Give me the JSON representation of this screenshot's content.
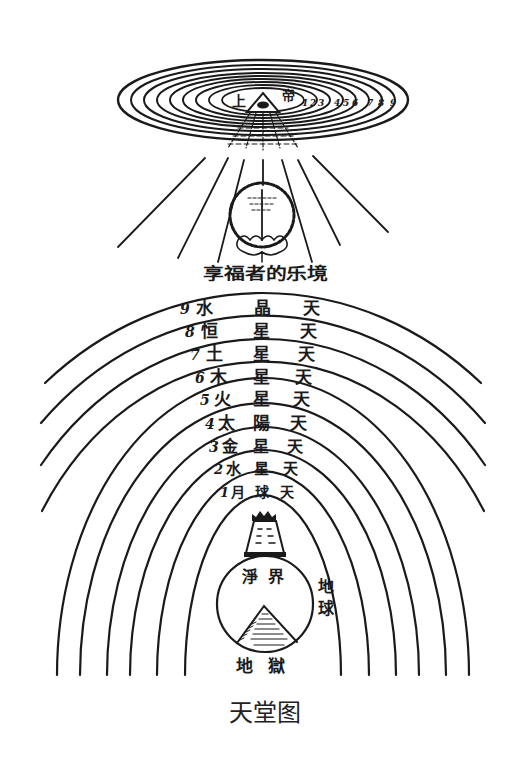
{
  "figure": {
    "caption": "天堂图",
    "top_label": {
      "left": "上",
      "right": "帝"
    },
    "top_ring_numbers": [
      "1",
      "2",
      "3",
      "4",
      "5",
      "6",
      "7",
      "8",
      "9"
    ],
    "blessed_label": "享福者的乐境",
    "spheres": [
      {
        "num": "9",
        "a": "水",
        "b": "晶",
        "c": "天"
      },
      {
        "num": "8",
        "a": "恒",
        "b": "星",
        "c": "天"
      },
      {
        "num": "7",
        "a": "土",
        "b": "星",
        "c": "天"
      },
      {
        "num": "6",
        "a": "木",
        "b": "星",
        "c": "天"
      },
      {
        "num": "5",
        "a": "火",
        "b": "星",
        "c": "天"
      },
      {
        "num": "4",
        "a": "太",
        "b": "陽",
        "c": "天"
      },
      {
        "num": "3",
        "a": "金",
        "b": "星",
        "c": "天"
      },
      {
        "num": "2",
        "a": "水",
        "b": "星",
        "c": "天"
      },
      {
        "num": "1",
        "a": "月",
        "b": "球",
        "c": "天"
      }
    ],
    "purgatory_label": {
      "a": "淨",
      "b": "界"
    },
    "earth_label": {
      "a": "地",
      "b": "球"
    },
    "hell_label": {
      "a": "地",
      "b": "獄"
    }
  }
}
